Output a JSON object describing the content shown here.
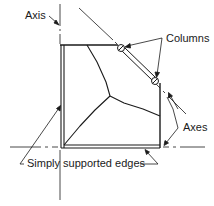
{
  "labels": {
    "axis": "Axis",
    "columns": "Columns",
    "axes": "Axes",
    "simply_supported_edges": "Simply supported edges"
  },
  "colors": {
    "ink": "#1a1a1a",
    "background": "#ffffff"
  }
}
